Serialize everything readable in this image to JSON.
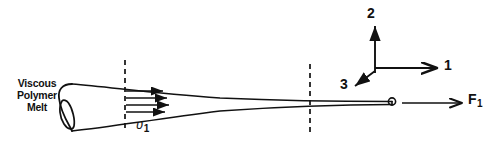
{
  "figure": {
    "width": 500,
    "height": 146,
    "background_color": "#ffffff",
    "stroke_color": "#111111"
  },
  "labels": {
    "melt_line1": "Viscous",
    "melt_line2": "Polymer",
    "melt_line3": "Melt",
    "velocity_symbol": "υ",
    "velocity_subscript": "1",
    "force_symbol": "F",
    "force_subscript": "1",
    "axis_1": "1",
    "axis_2": "2",
    "axis_3": "3"
  },
  "geometry": {
    "cylinder_ellipse": {
      "cx": 72,
      "cy": 107,
      "rx": 10,
      "ry": 25
    },
    "cone_top_start": {
      "x": 72,
      "y": 84
    },
    "cone_bottom_start": {
      "x": 72,
      "y": 131
    },
    "fiber_tip": {
      "x": 392,
      "y": 104
    },
    "fiber_tip_marker": {
      "cx": 392,
      "cy": 102,
      "r": 3.5
    },
    "dashed_line_1_x": 125,
    "dashed_line_1_y_top": 60,
    "dashed_line_1_y_bottom": 130,
    "dashed_line_2_x": 310,
    "dashed_line_2_y_top": 64,
    "dashed_line_2_y_bottom": 136,
    "velocity_arrow_count": 4,
    "velocity_arrow_x_start": 126,
    "velocity_arrow_y_values": [
      91,
      98,
      105,
      112
    ],
    "velocity_arrow_x_ends": [
      166,
      170,
      172,
      168
    ],
    "axes_origin": {
      "x": 375,
      "y": 73
    },
    "axis_2_tip": {
      "x": 375,
      "y": 22
    },
    "axis_1_tip": {
      "x": 441,
      "y": 67
    },
    "axis_3_tip": {
      "x": 352,
      "y": 88
    },
    "force_arrow_start": {
      "x": 402,
      "y": 103
    },
    "force_arrow_end": {
      "x": 464,
      "y": 103
    }
  }
}
